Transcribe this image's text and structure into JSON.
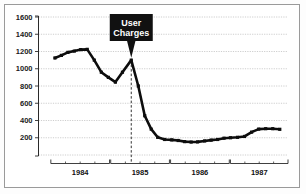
{
  "figure": {
    "title": "",
    "frame_color": "#9a9a9a",
    "background": "#ffffff"
  },
  "callout": {
    "line1": "User",
    "line2": "Charges",
    "box_color": "#111111",
    "text_color": "#ffffff"
  },
  "chart_data": {
    "type": "line",
    "title": "",
    "xlabel": "",
    "ylabel": "",
    "ylim": [
      0,
      1600
    ],
    "yticks": [
      200,
      400,
      600,
      800,
      1000,
      1200,
      1400,
      1600
    ],
    "ytick_labels": [
      "200",
      "400",
      "600",
      "800",
      "1000",
      "1200",
      "1400",
      "1600"
    ],
    "grid": true,
    "legend": "none",
    "line_color": "#0d0d0d",
    "marker": "square",
    "xlim": [
      1983.75,
      1988.0
    ],
    "x_group_labels": [
      "1984",
      "1985",
      "1986",
      "1987"
    ],
    "x_group_spans": [
      [
        1983.96,
        1984.96
      ],
      [
        1984.98,
        1985.98
      ],
      [
        1986.0,
        1987.0
      ],
      [
        1987.02,
        1988.0
      ]
    ],
    "annotation": {
      "label": "User Charges",
      "x": 1985.33,
      "y": 1100,
      "style": "black-box-with-pointer",
      "vline": true
    },
    "series": [
      {
        "name": "Volume",
        "x": [
          1984.03,
          1984.14,
          1984.25,
          1984.36,
          1984.47,
          1984.58,
          1984.7,
          1984.82,
          1984.94,
          1985.06,
          1985.18,
          1985.33,
          1985.45,
          1985.56,
          1985.67,
          1985.78,
          1985.9,
          1986.02,
          1986.13,
          1986.24,
          1986.35,
          1986.46,
          1986.58,
          1986.69,
          1986.8,
          1986.91,
          1987.02,
          1987.14,
          1987.26,
          1987.38,
          1987.5,
          1987.62,
          1987.74,
          1987.86
        ],
        "y": [
          1125,
          1155,
          1190,
          1205,
          1222,
          1225,
          1100,
          960,
          900,
          845,
          960,
          1100,
          800,
          455,
          300,
          205,
          180,
          175,
          168,
          155,
          150,
          152,
          163,
          172,
          180,
          195,
          200,
          205,
          215,
          265,
          300,
          305,
          305,
          298
        ]
      }
    ]
  }
}
